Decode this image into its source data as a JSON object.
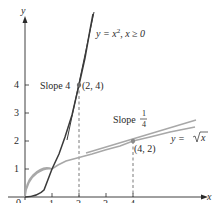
{
  "figure": {
    "axes": {
      "x_label": "x",
      "y_label": "y",
      "origin_label": "0",
      "x_ticks": [
        "1",
        "2",
        "3",
        "4"
      ],
      "y_ticks": [
        "1",
        "2",
        "3",
        "4"
      ]
    },
    "curves": [
      {
        "name": "parabola",
        "label_prefix": "y = x",
        "label_exp": "2",
        "label_suffix": ", x ≥ 0",
        "color": "#3a3a3a"
      },
      {
        "name": "sqrt",
        "label_prefix": "y = ",
        "label_radicand": "x",
        "color": "#a8a8a8"
      }
    ],
    "tangents": [
      {
        "point_label": "(2, 4)",
        "slope_label": "Slope 4"
      },
      {
        "point_label": "(4, 2)",
        "slope_label": "Slope",
        "slope_num": "1",
        "slope_den": "4"
      }
    ],
    "colors": {
      "axis": "#2a2a2a",
      "parabola": "#3a3a3a",
      "sqrt": "#a8a8a8",
      "dashed": "#555555"
    }
  }
}
